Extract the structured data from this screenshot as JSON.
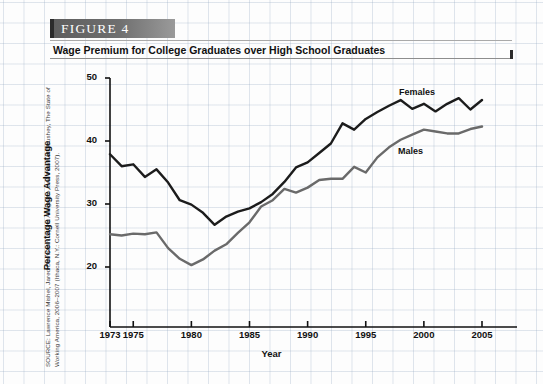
{
  "figure": {
    "banner_label": "FIGURE  4",
    "title": "Wage Premium for College Graduates over High School Graduates",
    "source": "SOURCE: Lawrence Mishel, Jared Bernstein, Sylvia Allegretto, and Heather Boushey, The State of Working America, 2006–2007 (Ithaca, N.Y.: Cornell University Press, 2007)."
  },
  "chart_data": {
    "type": "line",
    "title": "Wage Premium for College Graduates over High School Graduates",
    "xlabel": "Year",
    "ylabel": "Percentage Wage Advantage",
    "xlim": [
      1973,
      2005
    ],
    "ylim": [
      15,
      50
    ],
    "yticks": [
      20,
      30,
      40,
      50
    ],
    "xticks": [
      1973,
      1975,
      1980,
      1985,
      1990,
      1995,
      2000,
      2005
    ],
    "grid": true,
    "legend_position": "inline-annotation",
    "x": [
      1973,
      1974,
      1975,
      1976,
      1977,
      1978,
      1979,
      1980,
      1981,
      1982,
      1983,
      1984,
      1985,
      1986,
      1987,
      1988,
      1989,
      1990,
      1991,
      1992,
      1993,
      1994,
      1995,
      1996,
      1997,
      1998,
      1999,
      2000,
      2001,
      2002,
      2003,
      2004,
      2005
    ],
    "series": [
      {
        "name": "Females",
        "color": "#1c1c1c",
        "values": [
          37.9,
          36.0,
          36.3,
          34.3,
          35.5,
          33.4,
          30.6,
          29.9,
          28.6,
          26.7,
          28.0,
          28.8,
          29.3,
          30.3,
          31.6,
          33.5,
          35.8,
          36.6,
          38.1,
          39.6,
          42.8,
          41.8,
          43.5,
          44.6,
          45.6,
          46.5,
          45.1,
          45.9,
          44.7,
          45.9,
          46.8,
          45.0,
          46.5
        ]
      },
      {
        "name": "Males",
        "color": "#6a6a6a",
        "values": [
          25.2,
          25.0,
          25.3,
          25.2,
          25.5,
          23.0,
          21.3,
          20.3,
          21.2,
          22.6,
          23.6,
          25.4,
          27.1,
          29.6,
          30.6,
          32.4,
          31.8,
          32.6,
          33.8,
          34.0,
          34.0,
          35.9,
          35.0,
          37.4,
          39.0,
          40.2,
          41.0,
          41.8,
          41.5,
          41.2,
          41.2,
          41.9,
          42.3
        ]
      }
    ]
  }
}
